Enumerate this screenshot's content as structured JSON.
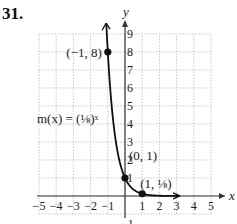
{
  "problem_number": "31.",
  "chart_data": {
    "type": "line",
    "title": "",
    "xlabel": "x",
    "ylabel": "y",
    "xlim": [
      -5,
      5
    ],
    "ylim": [
      -1,
      9
    ],
    "grid": true,
    "x_ticks": [
      "-5",
      "-4",
      "-3",
      "-2",
      "-1",
      "1",
      "2",
      "3",
      "4",
      "5"
    ],
    "y_ticks": [
      "-1",
      "1",
      "2",
      "3",
      "4",
      "5",
      "6",
      "7",
      "8",
      "9"
    ],
    "function_label": "m(x) = (1/8)^x",
    "series": [
      {
        "name": "m(x) = (1/8)^x",
        "x_range": [
          -1.1,
          3.2
        ],
        "base": 0.125
      }
    ],
    "points": [
      {
        "x": -1,
        "y": 8,
        "label": "(−1, 8)"
      },
      {
        "x": 0,
        "y": 1,
        "label": "(0, 1)"
      },
      {
        "x": 1,
        "y": 0.125,
        "label": "(1, 1/8)"
      }
    ]
  }
}
